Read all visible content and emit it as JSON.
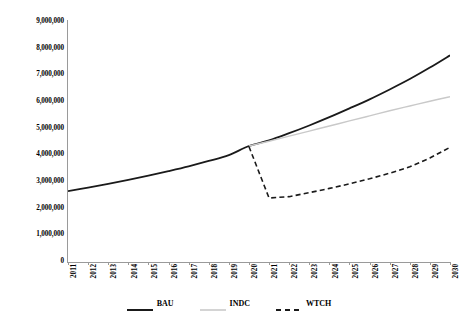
{
  "chart_data": {
    "type": "line",
    "title": "",
    "subtitle": "",
    "xlabel": "",
    "ylabel": "",
    "xlim": [
      2011,
      2030
    ],
    "ylim": [
      0,
      9000000
    ],
    "grid": false,
    "legend_position": "bottom",
    "x": [
      2011,
      2012,
      2013,
      2014,
      2015,
      2016,
      2017,
      2018,
      2019,
      2020,
      2021,
      2022,
      2023,
      2024,
      2025,
      2026,
      2027,
      2028,
      2029,
      2030
    ],
    "categories": [
      "2011",
      "2012",
      "2013",
      "2014",
      "2015",
      "2016",
      "2017",
      "2018",
      "2019",
      "2020",
      "2021",
      "2022",
      "2023",
      "2024",
      "2025",
      "2026",
      "2027",
      "2028",
      "2029",
      "2030"
    ],
    "ytick_labels": [
      "0",
      "1,000,000",
      "2,000,000",
      "3,000,000",
      "4,000,000",
      "5,000,000",
      "6,000,000",
      "7,000,000",
      "8,000,000",
      "9,000,000"
    ],
    "ytick_values": [
      0,
      1000000,
      2000000,
      3000000,
      4000000,
      5000000,
      6000000,
      7000000,
      8000000,
      9000000
    ],
    "series": [
      {
        "name": "BAU",
        "color": "#1a1a1a",
        "style": "solid",
        "width": 1.8,
        "values": [
          2660000,
          2790000,
          2930000,
          3080000,
          3240000,
          3410000,
          3590000,
          3790000,
          4010000,
          4350000,
          4560000,
          4830000,
          5120000,
          5430000,
          5760000,
          6100000,
          6470000,
          6860000,
          7290000,
          7750000
        ]
      },
      {
        "name": "INDC",
        "color": "#c9c9c9",
        "style": "solid",
        "width": 1.4,
        "values": [
          null,
          null,
          null,
          null,
          null,
          null,
          null,
          null,
          null,
          4350000,
          4530000,
          4720000,
          4910000,
          5100000,
          5290000,
          5480000,
          5670000,
          5850000,
          6030000,
          6200000
        ]
      },
      {
        "name": "WTCH",
        "color": "#1a1a1a",
        "style": "dashed",
        "width": 1.6,
        "values": [
          null,
          null,
          null,
          null,
          null,
          null,
          null,
          null,
          null,
          4330000,
          2400000,
          2450000,
          2600000,
          2760000,
          2930000,
          3120000,
          3330000,
          3570000,
          3900000,
          4300000
        ]
      }
    ]
  },
  "legend": {
    "items": [
      {
        "label": "BAU",
        "color": "#1a1a1a",
        "style": "solid"
      },
      {
        "label": "INDC",
        "color": "#c9c9c9",
        "style": "solid"
      },
      {
        "label": "WTCH",
        "color": "#1a1a1a",
        "style": "dashed"
      }
    ]
  }
}
